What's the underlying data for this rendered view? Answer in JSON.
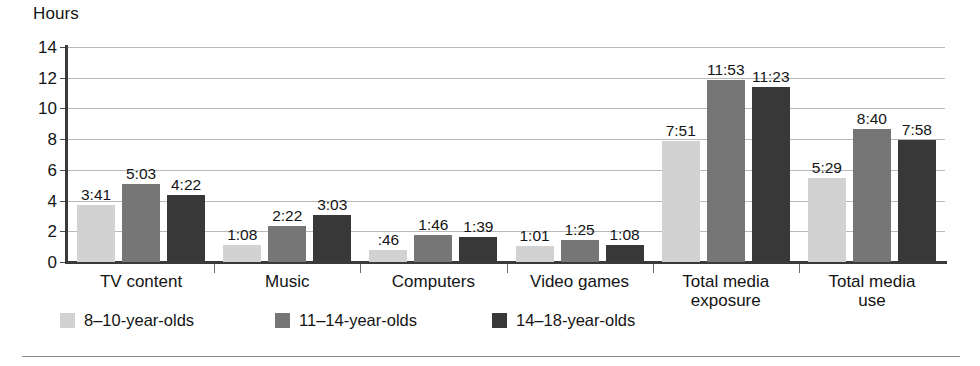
{
  "chart_data": {
    "type": "bar",
    "title": "",
    "ylabel": "Hours",
    "xlabel": "",
    "ylim": [
      0,
      14
    ],
    "yticks": [
      0,
      2,
      4,
      6,
      8,
      10,
      12,
      14
    ],
    "grid": true,
    "legend_position": "bottom-left",
    "categories": [
      "TV content",
      "Music",
      "Computers",
      "Video games",
      "Total media\nexposure",
      "Total media\nuse"
    ],
    "series": [
      {
        "name": "8–10-year-olds",
        "color": "#d2d2d2",
        "labels": [
          "3:41",
          "1:08",
          ":46",
          "1:01",
          "7:51",
          "5:29"
        ],
        "values": [
          3.683,
          1.133,
          0.767,
          1.017,
          7.85,
          5.483
        ]
      },
      {
        "name": "11–14-year-olds",
        "color": "#767676",
        "labels": [
          "5:03",
          "2:22",
          "1:46",
          "1:25",
          "11:53",
          "8:40"
        ],
        "values": [
          5.05,
          2.367,
          1.767,
          1.417,
          11.883,
          8.667
        ]
      },
      {
        "name": "14–18-year-olds",
        "color": "#383838",
        "labels": [
          "4:22",
          "3:03",
          "1:39",
          "1:08",
          "11:23",
          "7:58"
        ],
        "values": [
          4.367,
          3.05,
          1.65,
          1.133,
          11.383,
          7.967
        ]
      }
    ]
  }
}
